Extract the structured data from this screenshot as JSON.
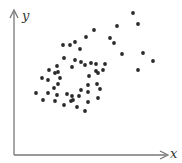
{
  "chart_data": {
    "type": "scatter",
    "title": "",
    "xlabel": "x",
    "ylabel": "y",
    "grid": false,
    "legend": null,
    "ticks": {
      "x": [],
      "y": []
    },
    "colors": {
      "axis": "#777777",
      "point": "#2a2a2a",
      "label": "#333333"
    },
    "pixel_frame": {
      "origin": [
        14,
        155
      ],
      "x_end": 168,
      "y_top": 10
    },
    "points_px": [
      [
        133,
        13
      ],
      [
        138,
        24
      ],
      [
        117,
        26
      ],
      [
        94,
        30
      ],
      [
        110,
        38
      ],
      [
        114,
        43
      ],
      [
        122,
        54
      ],
      [
        143,
        53
      ],
      [
        153,
        61
      ],
      [
        138,
        70
      ],
      [
        86,
        37
      ],
      [
        75,
        42
      ],
      [
        63,
        45
      ],
      [
        70,
        45
      ],
      [
        80,
        49
      ],
      [
        64,
        58
      ],
      [
        75,
        60
      ],
      [
        81,
        62
      ],
      [
        72,
        67
      ],
      [
        91,
        63
      ],
      [
        96,
        64
      ],
      [
        96,
        71
      ],
      [
        89,
        76
      ],
      [
        98,
        73
      ],
      [
        103,
        70
      ],
      [
        105,
        64
      ],
      [
        49,
        70
      ],
      [
        42,
        78
      ],
      [
        55,
        73
      ],
      [
        58,
        72
      ],
      [
        57,
        66
      ],
      [
        48,
        80
      ],
      [
        85,
        65
      ],
      [
        36,
        93
      ],
      [
        48,
        93
      ],
      [
        54,
        88
      ],
      [
        58,
        84
      ],
      [
        60,
        78
      ],
      [
        43,
        100
      ],
      [
        55,
        101
      ],
      [
        57,
        95
      ],
      [
        67,
        94
      ],
      [
        71,
        101
      ],
      [
        79,
        96
      ],
      [
        72,
        96
      ],
      [
        81,
        90
      ],
      [
        88,
        92
      ],
      [
        88,
        85
      ],
      [
        97,
        84
      ],
      [
        100,
        89
      ],
      [
        98,
        98
      ],
      [
        88,
        102
      ],
      [
        85,
        111
      ],
      [
        73,
        100
      ],
      [
        64,
        105
      ],
      [
        77,
        107
      ]
    ],
    "note": "Unlabeled axes; positive correlation between x and y"
  }
}
